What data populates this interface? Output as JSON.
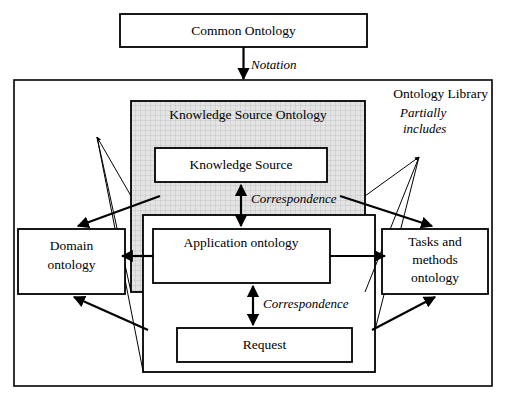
{
  "diagram": {
    "title_box": {
      "label": "Common Ontology"
    },
    "library": {
      "label": "Ontology Library"
    },
    "knowledge_source_ontology": {
      "label": "Knowledge Source Ontology"
    },
    "nodes": {
      "knowledge_source": "Knowledge Source",
      "application_ontology": "Application ontology",
      "request": "Request",
      "domain_ontology_line1": "Domain",
      "domain_ontology_line2": "ontology",
      "tasks_line1": "Tasks and",
      "tasks_line2": "methods",
      "tasks_line3": "ontology"
    },
    "edge_labels": {
      "notation": "Notation",
      "correspondence_upper": "Correspondence",
      "correspondence_lower": "Correspondence",
      "partially_includes_line1": "Partially",
      "partially_includes_line2": "includes"
    },
    "colors": {
      "stroke": "#000000",
      "shaded_fill": "#dcdcdc",
      "background": "#ffffff"
    }
  }
}
